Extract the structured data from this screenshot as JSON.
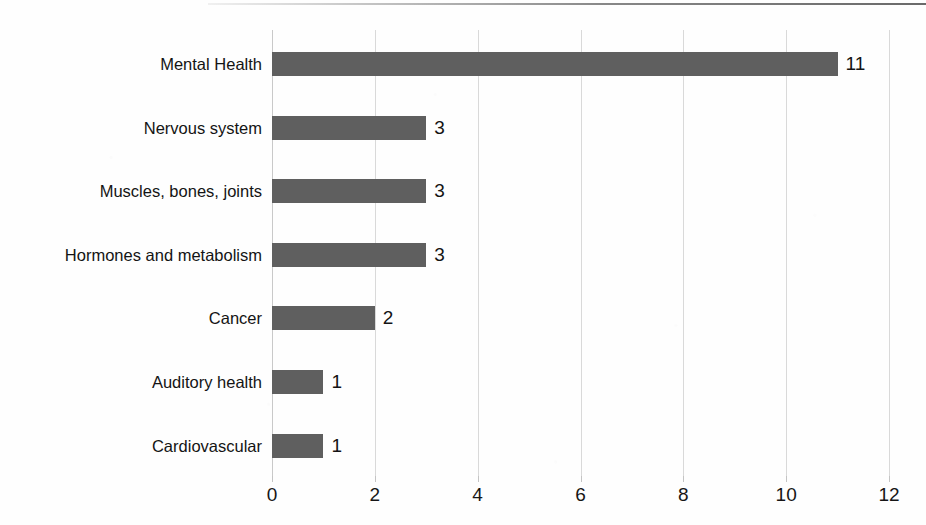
{
  "chart_data": {
    "type": "bar",
    "orientation": "horizontal",
    "title": "",
    "subtitle": "",
    "xlabel": "",
    "ylabel": "",
    "categories": [
      "Mental Health",
      "Nervous system",
      "Muscles, bones, joints",
      "Hormones and metabolism",
      "Cancer",
      "Auditory health",
      "Cardiovascular"
    ],
    "values": [
      11,
      3,
      3,
      3,
      2,
      1,
      1
    ],
    "data_labels": [
      "11",
      "3",
      "3",
      "3",
      "2",
      "1",
      "1"
    ],
    "xlim": [
      0,
      12
    ],
    "xticks": [
      0,
      2,
      4,
      6,
      8,
      10,
      12
    ],
    "xtick_labels": [
      "0",
      "2",
      "4",
      "6",
      "8",
      "10",
      "12"
    ],
    "grid": true,
    "grid_axis": "x",
    "legend": false,
    "legend_position": "none",
    "bar_color": "#5f5f5f",
    "gridline_color": "#d9d9d9",
    "background_color": "#fefefe",
    "text_color": "#141414"
  },
  "figure": {
    "top_rule_color": "#5a5a5a"
  }
}
